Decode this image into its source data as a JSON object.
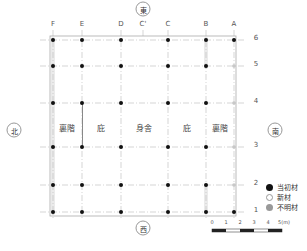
{
  "diagram": {
    "type": "architectural-floor-plan",
    "orientation": {
      "top": "東",
      "bottom": "西",
      "left": "北",
      "right": "南"
    },
    "columns": [
      {
        "label": "F",
        "x": 53
      },
      {
        "label": "E",
        "x": 82
      },
      {
        "label": "D",
        "x": 121
      },
      {
        "label": "C'",
        "x": 143
      },
      {
        "label": "C",
        "x": 168
      },
      {
        "label": "B",
        "x": 206
      },
      {
        "label": "A",
        "x": 234
      }
    ],
    "rows": [
      {
        "label": "6",
        "y": 40
      },
      {
        "label": "5",
        "y": 66
      },
      {
        "label": "4",
        "y": 103
      },
      {
        "label": "3",
        "y": 147
      },
      {
        "label": "2",
        "y": 185
      },
      {
        "label": "1",
        "y": 212
      }
    ],
    "rooms": [
      {
        "label": "裏階",
        "x": 67
      },
      {
        "label": "庇",
        "x": 101
      },
      {
        "label": "身舎",
        "x": 144
      },
      {
        "label": "庇",
        "x": 187
      },
      {
        "label": "裏階",
        "x": 220
      }
    ],
    "room_label_y": 127,
    "posts": {
      "6": [
        "original",
        "original",
        "original",
        null,
        "original",
        "original",
        "original"
      ],
      "5": [
        "original",
        "original",
        "original",
        null,
        "original",
        "original",
        "unknown"
      ],
      "4": [
        "original",
        "original",
        "original",
        null,
        "original",
        "original",
        "unknown"
      ],
      "3": [
        "original",
        "original",
        "original",
        null,
        "original",
        "original",
        "unknown"
      ],
      "2": [
        "original",
        "original",
        "original",
        null,
        "original",
        "original",
        "unknown"
      ],
      "1": [
        "original",
        "original",
        "original",
        null,
        "original",
        "original",
        "original"
      ]
    },
    "legend": {
      "original": {
        "label": "当初材",
        "color": "#111111"
      },
      "new": {
        "label": "新材",
        "color": "#ffffff"
      },
      "unknown": {
        "label": "不明材",
        "color": "#999999"
      }
    },
    "scale": {
      "ticks": [
        "0",
        "1",
        "2",
        "3",
        "4",
        "5(m)"
      ]
    }
  }
}
